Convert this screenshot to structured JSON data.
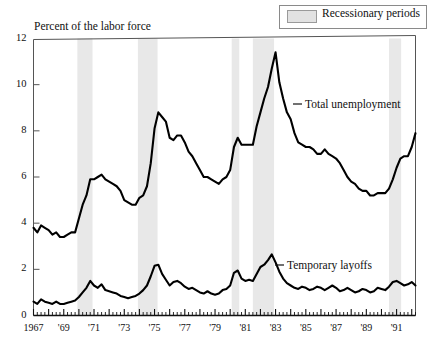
{
  "legend": {
    "label": "Recessionary periods",
    "swatch_color": "#e2e2e2"
  },
  "axis_title": "Percent of the labor force",
  "labels": {
    "total_unemployment": "Total unemployment",
    "temporary_layoffs": "Temporary layoffs"
  },
  "chart_data": {
    "type": "line",
    "title": "",
    "subtitle": "",
    "xlabel": "",
    "ylabel": "Percent of the labor force",
    "ylim": [
      0,
      12
    ],
    "xlim": [
      1967.0,
      1992.25
    ],
    "yticks": [
      0,
      2,
      4,
      6,
      8,
      10,
      12
    ],
    "xticks": [
      1967,
      1969,
      1971,
      1973,
      1975,
      1977,
      1979,
      1981,
      1983,
      1985,
      1987,
      1989,
      1991
    ],
    "xtick_labels": [
      "1967",
      "'69",
      "'71",
      "'73",
      "'75",
      "'77",
      "'79",
      "'81",
      "'83",
      "'85",
      "'87",
      "'89",
      "'91"
    ],
    "grid": false,
    "legend_position": "top-right",
    "line_color": "#000000",
    "minor_tick_interval_years": 0.25,
    "shaded_regions": [
      {
        "label": "Recessionary periods",
        "start": 1969.9,
        "end": 1970.9,
        "color": "#e8e8e8"
      },
      {
        "label": "Recessionary periods",
        "start": 1973.9,
        "end": 1975.2,
        "color": "#e8e8e8"
      },
      {
        "label": "Recessionary periods",
        "start": 1980.1,
        "end": 1980.6,
        "color": "#e8e8e8"
      },
      {
        "label": "Recessionary periods",
        "start": 1981.5,
        "end": 1982.9,
        "color": "#e8e8e8"
      },
      {
        "label": "Recessionary periods",
        "start": 1990.5,
        "end": 1991.3,
        "color": "#e8e8e8"
      }
    ],
    "series": [
      {
        "name": "Total unemployment",
        "x": [
          1967.0,
          1967.25,
          1967.5,
          1967.75,
          1968.0,
          1968.25,
          1968.5,
          1968.75,
          1969.0,
          1969.25,
          1969.5,
          1969.75,
          1970.0,
          1970.25,
          1970.5,
          1970.75,
          1971.0,
          1971.25,
          1971.5,
          1971.75,
          1972.0,
          1972.25,
          1972.5,
          1972.75,
          1973.0,
          1973.25,
          1973.5,
          1973.75,
          1974.0,
          1974.25,
          1974.5,
          1974.75,
          1975.0,
          1975.25,
          1975.5,
          1975.75,
          1976.0,
          1976.25,
          1976.5,
          1976.75,
          1977.0,
          1977.25,
          1977.5,
          1977.75,
          1978.0,
          1978.25,
          1978.5,
          1978.75,
          1979.0,
          1979.25,
          1979.5,
          1979.75,
          1980.0,
          1980.25,
          1980.5,
          1980.75,
          1981.0,
          1981.25,
          1981.5,
          1981.75,
          1982.0,
          1982.25,
          1982.5,
          1982.75,
          1983.0,
          1983.25,
          1983.5,
          1983.75,
          1984.0,
          1984.25,
          1984.5,
          1984.75,
          1985.0,
          1985.25,
          1985.5,
          1985.75,
          1986.0,
          1986.25,
          1986.5,
          1986.75,
          1987.0,
          1987.25,
          1987.5,
          1987.75,
          1988.0,
          1988.25,
          1988.5,
          1988.75,
          1989.0,
          1989.25,
          1989.5,
          1989.75,
          1990.0,
          1990.25,
          1990.5,
          1990.75,
          1991.0,
          1991.25,
          1991.5,
          1991.75,
          1992.0,
          1992.25
        ],
        "values": [
          3.8,
          3.6,
          3.9,
          3.8,
          3.7,
          3.5,
          3.6,
          3.4,
          3.4,
          3.5,
          3.6,
          3.6,
          4.2,
          4.8,
          5.2,
          5.9,
          5.9,
          6.0,
          6.1,
          5.9,
          5.8,
          5.7,
          5.6,
          5.4,
          5.0,
          4.9,
          4.8,
          4.8,
          5.1,
          5.2,
          5.6,
          6.6,
          8.1,
          8.8,
          8.6,
          8.4,
          7.7,
          7.6,
          7.8,
          7.8,
          7.5,
          7.1,
          6.9,
          6.6,
          6.3,
          6.0,
          6.0,
          5.9,
          5.8,
          5.7,
          5.9,
          6.0,
          6.3,
          7.3,
          7.7,
          7.4,
          7.4,
          7.4,
          7.4,
          8.2,
          8.8,
          9.4,
          9.9,
          10.7,
          11.4,
          10.1,
          9.4,
          8.8,
          8.5,
          7.9,
          7.5,
          7.4,
          7.3,
          7.3,
          7.2,
          7.0,
          7.0,
          7.2,
          7.0,
          6.9,
          6.8,
          6.6,
          6.3,
          6.0,
          5.8,
          5.7,
          5.5,
          5.4,
          5.4,
          5.2,
          5.2,
          5.3,
          5.3,
          5.3,
          5.5,
          5.9,
          6.4,
          6.8,
          6.9,
          6.9,
          7.3,
          7.9
        ]
      },
      {
        "name": "Temporary layoffs",
        "x": [
          1967.0,
          1967.25,
          1967.5,
          1967.75,
          1968.0,
          1968.25,
          1968.5,
          1968.75,
          1969.0,
          1969.25,
          1969.5,
          1969.75,
          1970.0,
          1970.25,
          1970.5,
          1970.75,
          1971.0,
          1971.25,
          1971.5,
          1971.75,
          1972.0,
          1972.25,
          1972.5,
          1972.75,
          1973.0,
          1973.25,
          1973.5,
          1973.75,
          1974.0,
          1974.25,
          1974.5,
          1974.75,
          1975.0,
          1975.25,
          1975.5,
          1975.75,
          1976.0,
          1976.25,
          1976.5,
          1976.75,
          1977.0,
          1977.25,
          1977.5,
          1977.75,
          1978.0,
          1978.25,
          1978.5,
          1978.75,
          1979.0,
          1979.25,
          1979.5,
          1979.75,
          1980.0,
          1980.25,
          1980.5,
          1980.75,
          1981.0,
          1981.25,
          1981.5,
          1981.75,
          1982.0,
          1982.25,
          1982.5,
          1982.75,
          1983.0,
          1983.25,
          1983.5,
          1983.75,
          1984.0,
          1984.25,
          1984.5,
          1984.75,
          1985.0,
          1985.25,
          1985.5,
          1985.75,
          1986.0,
          1986.25,
          1986.5,
          1986.75,
          1987.0,
          1987.25,
          1987.5,
          1987.75,
          1988.0,
          1988.25,
          1988.5,
          1988.75,
          1989.0,
          1989.25,
          1989.5,
          1989.75,
          1990.0,
          1990.25,
          1990.5,
          1990.75,
          1991.0,
          1991.25,
          1991.5,
          1991.75,
          1992.0,
          1992.25
        ],
        "values": [
          0.6,
          0.5,
          0.7,
          0.6,
          0.55,
          0.5,
          0.6,
          0.5,
          0.5,
          0.55,
          0.6,
          0.65,
          0.8,
          1.0,
          1.2,
          1.5,
          1.3,
          1.2,
          1.35,
          1.1,
          1.05,
          1.0,
          0.95,
          0.85,
          0.8,
          0.75,
          0.8,
          0.85,
          0.95,
          1.1,
          1.3,
          1.7,
          2.15,
          2.2,
          1.8,
          1.55,
          1.3,
          1.45,
          1.5,
          1.4,
          1.25,
          1.15,
          1.2,
          1.1,
          1.0,
          0.95,
          1.05,
          0.95,
          0.9,
          0.95,
          1.1,
          1.15,
          1.3,
          1.85,
          1.95,
          1.6,
          1.5,
          1.55,
          1.5,
          1.8,
          2.1,
          2.2,
          2.4,
          2.65,
          2.3,
          1.9,
          1.6,
          1.4,
          1.3,
          1.2,
          1.15,
          1.25,
          1.2,
          1.1,
          1.15,
          1.25,
          1.2,
          1.1,
          1.2,
          1.3,
          1.2,
          1.05,
          1.1,
          1.2,
          1.1,
          1.0,
          1.05,
          1.15,
          1.1,
          1.0,
          1.05,
          1.2,
          1.15,
          1.1,
          1.25,
          1.45,
          1.5,
          1.4,
          1.3,
          1.35,
          1.45,
          1.3
        ]
      }
    ]
  }
}
